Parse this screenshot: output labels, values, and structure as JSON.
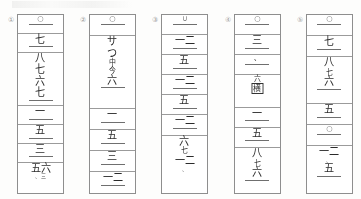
{
  "document": {
    "kind": "scanned-worksheet",
    "description": "Five vertical numeral columns in bordered grids",
    "background_color": "#fdfdfc",
    "ink_color": "#2b2b2b",
    "rule_color": "#9b9b9b"
  },
  "columns": [
    {
      "number_label": "①",
      "cells": [
        {
          "lines": [
            {
              "text": "○",
              "style": "circ",
              "underline": "normal"
            }
          ]
        },
        {
          "lines": [
            {
              "text": "七",
              "style": "normal",
              "underline": "normal"
            }
          ]
        },
        {
          "lines": [
            {
              "text": "八",
              "style": "normal",
              "underline": "none"
            },
            {
              "text": "七",
              "style": "normal",
              "underline": "none"
            },
            {
              "text": "六",
              "style": "normal",
              "underline": "none"
            },
            {
              "text": "七",
              "style": "normal",
              "underline": "normal"
            }
          ]
        },
        {
          "lines": [
            {
              "text": "一",
              "style": "normal",
              "underline": "normal"
            }
          ]
        },
        {
          "lines": [
            {
              "text": "五",
              "style": "normal",
              "underline": "normal"
            }
          ]
        },
        {
          "lines": [
            {
              "text": "三",
              "style": "normal",
              "underline": "normal"
            }
          ]
        },
        {
          "lines": [
            {
              "text": "五六",
              "style": "normal",
              "underline": "none"
            },
            {
              "text": "、三",
              "style": "xs",
              "underline": "none"
            }
          ]
        }
      ]
    },
    {
      "number_label": "②",
      "cells": [
        {
          "lines": [
            {
              "text": "○",
              "style": "circ",
              "underline": "normal"
            }
          ]
        },
        {
          "lines": [
            {
              "text": "サ",
              "style": "normal",
              "underline": "none"
            },
            {
              "text": "つ",
              "style": "normal",
              "underline": "none"
            },
            {
              "text": "中",
              "style": "sm",
              "underline": "none"
            },
            {
              "text": "今",
              "style": "sm",
              "underline": "none"
            },
            {
              "text": "六",
              "style": "normal",
              "underline": "normal"
            }
          ]
        },
        {
          "lines": [
            {
              "text": "一",
              "style": "normal",
              "underline": "normal"
            }
          ]
        },
        {
          "lines": [
            {
              "text": "五",
              "style": "normal",
              "underline": "normal"
            }
          ]
        },
        {
          "lines": [
            {
              "text": "三",
              "style": "normal",
              "underline": "normal"
            }
          ]
        },
        {
          "lines": [
            {
              "text": "一二",
              "style": "normal",
              "underline": "normal"
            }
          ]
        }
      ]
    },
    {
      "number_label": "③",
      "cells": [
        {
          "lines": [
            {
              "text": "∪",
              "style": "circ",
              "underline": "normal"
            }
          ]
        },
        {
          "lines": [
            {
              "text": "一二",
              "style": "normal",
              "underline": "normal"
            }
          ]
        },
        {
          "lines": [
            {
              "text": "五",
              "style": "normal",
              "underline": "normal"
            }
          ]
        },
        {
          "lines": [
            {
              "text": "一二",
              "style": "normal",
              "underline": "normal"
            }
          ]
        },
        {
          "lines": [
            {
              "text": "五",
              "style": "normal",
              "underline": "normal"
            }
          ]
        },
        {
          "lines": [
            {
              "text": "一二",
              "style": "normal",
              "underline": "normal"
            }
          ]
        },
        {
          "lines": [
            {
              "text": "六",
              "style": "normal",
              "underline": "none"
            },
            {
              "text": "七",
              "style": "sm",
              "underline": "none"
            },
            {
              "text": "一二",
              "style": "normal",
              "underline": "none"
            },
            {
              "text": "、",
              "style": "xs",
              "underline": "none"
            }
          ]
        }
      ]
    },
    {
      "number_label": "④",
      "cells": [
        {
          "lines": [
            {
              "text": "○",
              "style": "circ",
              "underline": "normal"
            }
          ]
        },
        {
          "lines": [
            {
              "text": "三",
              "style": "normal",
              "underline": "normal"
            }
          ]
        },
        {
          "lines": [
            {
              "text": "、",
              "style": "dot",
              "underline": "normal"
            }
          ]
        },
        {
          "lines": [
            {
              "text": "六",
              "style": "sm",
              "underline": "none"
            },
            {
              "text": "横",
              "style": "boxed",
              "underline": "none"
            }
          ]
        },
        {
          "lines": [
            {
              "text": "一",
              "style": "normal",
              "underline": "normal"
            }
          ]
        },
        {
          "lines": [
            {
              "text": "五",
              "style": "normal",
              "underline": "normal"
            }
          ]
        },
        {
          "lines": [
            {
              "text": "八",
              "style": "normal",
              "underline": "none"
            },
            {
              "text": "七",
              "style": "sm",
              "underline": "none"
            },
            {
              "text": "六",
              "style": "normal",
              "underline": "normal"
            }
          ]
        }
      ]
    },
    {
      "number_label": "⑤",
      "cells": [
        {
          "lines": [
            {
              "text": "○",
              "style": "circ",
              "underline": "normal"
            }
          ]
        },
        {
          "lines": [
            {
              "text": "七",
              "style": "normal",
              "underline": "normal"
            }
          ]
        },
        {
          "lines": [
            {
              "text": "八",
              "style": "normal",
              "underline": "none"
            },
            {
              "text": "七",
              "style": "sm",
              "underline": "none"
            },
            {
              "text": "六",
              "style": "normal",
              "underline": "normal"
            }
          ]
        },
        {
          "lines": [
            {
              "text": "五",
              "style": "normal",
              "underline": "normal"
            }
          ]
        },
        {
          "lines": [
            {
              "text": "○",
              "style": "circ",
              "underline": "normal"
            }
          ]
        },
        {
          "lines": [
            {
              "text": "一二",
              "style": "normal",
              "underline": "none"
            },
            {
              "text": "、",
              "style": "xs",
              "underline": "none"
            },
            {
              "text": "五",
              "style": "normal",
              "underline": "normal"
            }
          ]
        }
      ]
    }
  ]
}
